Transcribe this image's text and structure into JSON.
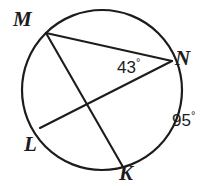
{
  "figure": {
    "type": "circle-with-chords",
    "background_color": "#ffffff",
    "stroke_color": "#1c1c1c",
    "text_color": "#1c1c1c",
    "circle": {
      "center_x": 102,
      "center_y": 90,
      "radius": 80,
      "stroke_width": 2.2
    },
    "points": {
      "M": {
        "x": 46,
        "y": 33
      },
      "N": {
        "x": 172,
        "y": 61
      },
      "L": {
        "x": 40,
        "y": 128
      },
      "K": {
        "x": 123,
        "y": 167
      }
    },
    "chords": [
      {
        "name": "chord-MN",
        "from": "M",
        "to": "N"
      },
      {
        "name": "chord-MK",
        "from": "M",
        "to": "K"
      },
      {
        "name": "chord-LN",
        "from": "L",
        "to": "N"
      }
    ],
    "labels": {
      "M": "M",
      "N": "N",
      "L": "L",
      "K": "K"
    },
    "angles": {
      "inscribed": {
        "value": "43",
        "degree_symbol": "°",
        "full": "43°"
      },
      "arc": {
        "value": "95",
        "degree_symbol": "°",
        "full": "95°"
      }
    }
  }
}
